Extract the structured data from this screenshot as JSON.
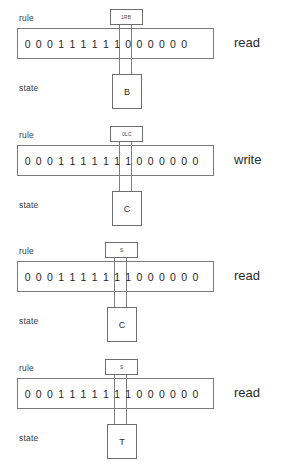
{
  "diagram": {
    "captions": {
      "rule": "rule",
      "state": "state"
    },
    "colors": {
      "box_border": "#6e6e6e",
      "tape_border": "#7a7a7a",
      "head_border": "#7e7e7e",
      "text": "#2b2b2b",
      "background": "#ffffff"
    },
    "head_cell_index": 9,
    "steps": [
      {
        "id": "step-1",
        "rule_label": "rule",
        "rule_value": "1RB",
        "tape": [
          "0",
          "0",
          "0",
          "1",
          "1",
          "1",
          "1",
          "1",
          "1",
          "0",
          "0",
          "0",
          "0",
          "0",
          "0"
        ],
        "state_label": "state",
        "state_value": "B",
        "action": "read"
      },
      {
        "id": "step-2",
        "rule_label": "rule",
        "rule_value": "0LC",
        "tape": [
          "0",
          "0",
          "0",
          "1",
          "1",
          "1",
          "1",
          "1",
          "1",
          "1",
          "0",
          "0",
          "0",
          "0",
          "0",
          "0"
        ],
        "state_label": "state",
        "state_value": "C",
        "action": "write"
      },
      {
        "id": "step-3",
        "rule_label": "rule",
        "rule_value": "S",
        "tape": [
          "0",
          "0",
          "0",
          "1",
          "1",
          "1",
          "1",
          "1",
          "1",
          "1",
          "0",
          "0",
          "0",
          "0",
          "0",
          "0"
        ],
        "state_label": "state",
        "state_value": "C",
        "action": "read"
      },
      {
        "id": "step-4",
        "rule_label": "rule",
        "rule_value": "S",
        "tape": [
          "0",
          "0",
          "0",
          "1",
          "1",
          "1",
          "1",
          "1",
          "1",
          "1",
          "0",
          "0",
          "0",
          "0",
          "0",
          "0"
        ],
        "state_label": "state",
        "state_value": "T",
        "action": "read"
      }
    ]
  }
}
